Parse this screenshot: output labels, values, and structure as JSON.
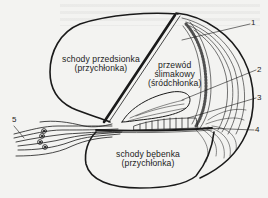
{
  "diagram": {
    "type": "anatomical cross-section",
    "regions": [
      {
        "id": "scala-vestibuli",
        "line1": "schody przedsionka",
        "line2": "(przychłonka)"
      },
      {
        "id": "cochlear-duct",
        "line1": "przewód",
        "line2": "ślimakowy",
        "line3": "(śródchłonka)"
      },
      {
        "id": "scala-tympani",
        "line1": "schody bębenka",
        "line2": "(przychłonka)"
      }
    ],
    "callouts": [
      {
        "number": "1"
      },
      {
        "number": "2"
      },
      {
        "number": "3"
      },
      {
        "number": "4"
      },
      {
        "number": "5"
      }
    ],
    "colors": {
      "line": "#1a1a1a",
      "background": "#f3f3f1"
    }
  }
}
